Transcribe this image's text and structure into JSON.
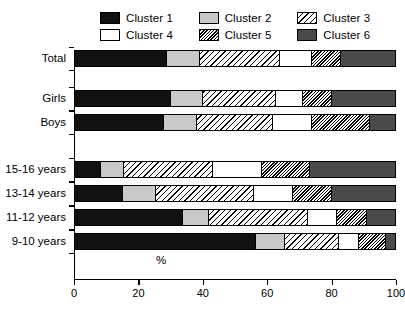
{
  "legend": {
    "items": [
      {
        "label": "Cluster 1",
        "key": "c1",
        "swatch": "solid-black"
      },
      {
        "label": "Cluster 2",
        "key": "c2",
        "swatch": "solid-light-gray"
      },
      {
        "label": "Cluster 3",
        "key": "c3",
        "swatch": "sparse-diagonal-hatch"
      },
      {
        "label": "Cluster 4",
        "key": "c4",
        "swatch": "solid-white"
      },
      {
        "label": "Cluster 5",
        "key": "c5",
        "swatch": "dense-diagonal-hatch"
      },
      {
        "label": "Cluster 6",
        "key": "c6",
        "swatch": "solid-dark-gray"
      }
    ]
  },
  "chart_data": {
    "type": "bar",
    "orientation": "horizontal",
    "stacked": true,
    "title": "",
    "xlabel": "%",
    "ylabel": "",
    "xlim": [
      0,
      100
    ],
    "xticks": [
      0,
      20,
      40,
      60,
      80,
      100
    ],
    "xticklabels": [
      "0",
      "20",
      "40",
      "60",
      "80",
      "100"
    ],
    "grid": false,
    "legend_position": "top",
    "categories": [
      "Total",
      "Girls",
      "Boys",
      "15-16 years",
      "13-14 years",
      "11-12 years",
      "9-10 years"
    ],
    "series": [
      {
        "name": "Cluster 1",
        "key": "c1",
        "values": [
          29,
          30,
          28,
          8,
          15,
          34,
          57
        ]
      },
      {
        "name": "Cluster 2",
        "key": "c2",
        "values": [
          10,
          10,
          10,
          7,
          10,
          8,
          9
        ]
      },
      {
        "name": "Cluster 3",
        "key": "c3",
        "values": [
          25,
          23,
          24,
          28,
          31,
          31,
          17
        ]
      },
      {
        "name": "Cluster 4",
        "key": "c4",
        "values": [
          10,
          8,
          12,
          15,
          12,
          9,
          6
        ]
      },
      {
        "name": "Cluster 5",
        "key": "c5",
        "values": [
          9,
          9,
          18,
          15,
          12,
          9,
          8
        ]
      },
      {
        "name": "Cluster 6",
        "key": "c6",
        "values": [
          17,
          20,
          8,
          27,
          20,
          9,
          3
        ]
      }
    ]
  },
  "axis": {
    "x_title": "%"
  }
}
